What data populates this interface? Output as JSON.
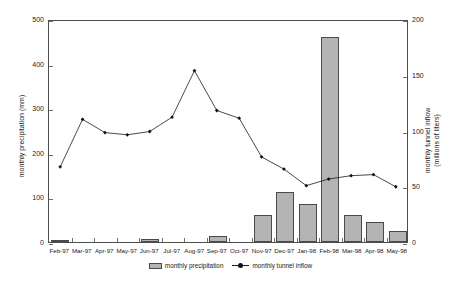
{
  "chart_data": {
    "type": "bar",
    "title": "",
    "xlabel": "",
    "categories": [
      "Feb-97",
      "Mar-97",
      "Apr-97",
      "May-97",
      "Jun-97",
      "Jul-97",
      "Aug-97",
      "Sep-97",
      "Oct-97",
      "Nov-97",
      "Dec-97",
      "Jan-98",
      "Feb-98",
      "Mar-98",
      "Apr-98",
      "May-98"
    ],
    "grid": false,
    "legend_position": "bottom-center",
    "series": [
      {
        "name": "monthly precipitation",
        "type": "bar",
        "axis": "left",
        "ylabel": "monthly precipitation (mm)",
        "unit": "mm",
        "ylim": [
          0,
          500
        ],
        "yticks": [
          0,
          100,
          200,
          300,
          400,
          500
        ],
        "color": "#b4b4b4",
        "edge_color": "#4a4a4a",
        "values": [
          5,
          0,
          0,
          0,
          6,
          0,
          0,
          13,
          0,
          60,
          112,
          85,
          460,
          60,
          45,
          25
        ]
      },
      {
        "name": "monthly tunnel inflow",
        "type": "line",
        "axis": "right",
        "ylabel": "monthly tunnel inflow (millions of liters)",
        "ylabel_line1": "monthly tunnel inflow",
        "ylabel_line2": "(millions of liters)",
        "unit": "millions of liters",
        "ylim": [
          0,
          200
        ],
        "yticks": [
          0,
          50,
          100,
          150,
          200
        ],
        "color": "#1a1a1a",
        "marker": "diamond",
        "values": [
          68,
          111,
          99,
          97,
          100,
          113,
          155,
          119,
          112,
          77,
          66,
          51,
          57,
          60,
          61,
          50
        ]
      }
    ]
  },
  "legend": {
    "entries": [
      {
        "label": "monthly precipitation",
        "marker": "bar-swatch"
      },
      {
        "label": "monthly tunnel inflow",
        "marker": "line-with-point"
      }
    ]
  }
}
